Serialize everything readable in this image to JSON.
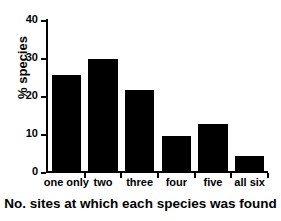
{
  "chart_data": {
    "type": "bar",
    "title": "",
    "categories": [
      "one only",
      "two",
      "three",
      "four",
      "five",
      "all six"
    ],
    "values": [
      25.2,
      29.4,
      21.2,
      9.2,
      12.5,
      4.0
    ],
    "xlabel": "No. sites at which each species was found",
    "ylabel": "% species",
    "ylim": [
      0,
      40
    ],
    "yticks": [
      0,
      10,
      20,
      30,
      40
    ],
    "ytick_labels": [
      "0",
      "10",
      "20",
      "30",
      "40"
    ],
    "grid": false,
    "legend": false,
    "bar_color": "#000000",
    "background_color": "#ffffff",
    "axis_color": "#000000"
  }
}
